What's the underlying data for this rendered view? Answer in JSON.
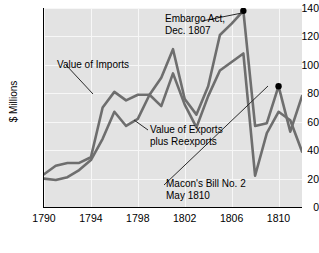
{
  "chart_data": {
    "type": "line",
    "title": "",
    "xlabel": "",
    "ylabel": "$ Millions",
    "xlim": [
      1790,
      1812
    ],
    "ylim": [
      0,
      140
    ],
    "grid": true,
    "legend": "inline-annotations",
    "x": [
      1790,
      1791,
      1792,
      1793,
      1794,
      1795,
      1796,
      1797,
      1798,
      1799,
      1800,
      1801,
      1802,
      1803,
      1804,
      1805,
      1806,
      1807,
      1808,
      1809,
      1810,
      1811,
      1812
    ],
    "series": [
      {
        "name": "Value of Imports",
        "color": "#6e6e6e",
        "values": [
          23,
          29,
          31,
          31,
          35,
          70,
          81,
          75,
          79,
          79,
          91,
          111,
          76,
          65,
          85,
          121,
          129,
          138,
          57,
          59,
          85,
          53,
          78
        ]
      },
      {
        "name": "Value of Exports plus Reexports",
        "color": "#6e6e6e",
        "values": [
          20,
          19,
          21,
          26,
          33,
          48,
          67,
          57,
          62,
          79,
          71,
          94,
          72,
          56,
          78,
          96,
          102,
          108,
          22,
          52,
          67,
          61,
          39
        ]
      }
    ],
    "y_ticks": [
      0,
      20,
      40,
      60,
      80,
      100,
      120,
      140
    ],
    "x_ticks": [
      1790,
      1794,
      1798,
      1802,
      1806,
      1810
    ],
    "markers": [
      {
        "label": "Embargo Act, Dec. 1807",
        "x": 1807,
        "y": 138
      },
      {
        "label": "Macon's Bill No. 2 May 1810",
        "x": 1810,
        "y": 85
      }
    ]
  },
  "y_ticks": [
    "140",
    "120",
    "100",
    "80",
    "60",
    "40",
    "20",
    "0"
  ],
  "x_ticks": [
    "1790",
    "1794",
    "1798",
    "1802",
    "1806",
    "1810"
  ],
  "axis": {
    "y_title": "$ Millions"
  },
  "annotations": {
    "imports_label": "Value of Imports",
    "exports_label_line1": "Value of Exports",
    "exports_label_line2": "plus Reexports",
    "embargo_line1": "Embargo Act,",
    "embargo_line2": "Dec. 1807",
    "macon_line1": "Macon's Bill No. 2",
    "macon_line2": "May 1810"
  }
}
